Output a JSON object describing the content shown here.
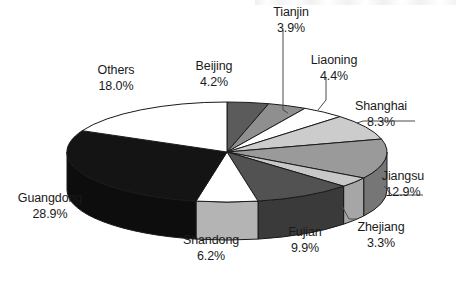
{
  "chart_data": {
    "type": "pie",
    "title": "",
    "subtitle": "",
    "units": "percent",
    "legend_position": "none",
    "labels_on_slices": false,
    "style": "3d-pie",
    "start_angle_deg": 0,
    "direction": "clockwise",
    "categories": [
      "Beijing",
      "Tianjin",
      "Liaoning",
      "Shanghai",
      "Jiangsu",
      "Zhejiang",
      "Fujian",
      "Shandong",
      "Guangdong",
      "Others"
    ],
    "values": [
      4.2,
      3.9,
      4.4,
      8.3,
      12.9,
      3.3,
      9.9,
      6.2,
      28.9,
      18.0
    ],
    "value_labels": [
      "4.2%",
      "3.9%",
      "4.4%",
      "8.3%",
      "12.9%",
      "3.3%",
      "9.9%",
      "6.2%",
      "28.9%",
      "18.0%"
    ],
    "slice_colors": [
      "#5b5b5b",
      "#8f8f8f",
      "#ffffff",
      "#cccccc",
      "#9a9a9a",
      "#c8c8c8",
      "#525252",
      "#ffffff",
      "#141414",
      "#ffffff"
    ],
    "slice_side_colors": [
      "#3f3f3f",
      "#6e6e6e",
      "#d6d6d6",
      "#a8a8a8",
      "#767676",
      "#a6a6a6",
      "#3a3a3a",
      "#b4b4b4",
      "#0d0d0d",
      "#d8d8d8"
    ],
    "outline_color": "#1a1a1a",
    "total": 100.0
  },
  "slices": [
    {
      "name": "Beijing",
      "pct": "4.2%",
      "label_x": 214,
      "label_y": 66,
      "align": "center",
      "leader": false
    },
    {
      "name": "Tianjin",
      "pct": "3.9%",
      "label_x": 291,
      "label_y": 12,
      "align": "center",
      "leader": true
    },
    {
      "name": "Liaoning",
      "pct": "4.4%",
      "label_x": 334,
      "label_y": 60,
      "align": "center",
      "leader": true
    },
    {
      "name": "Shanghai",
      "pct": "8.3%",
      "label_x": 378,
      "label_y": 106,
      "align": "center",
      "leader": true
    },
    {
      "name": "Jiangsu",
      "pct": "12.9%",
      "label_x": 400,
      "label_y": 176,
      "align": "center",
      "leader": true
    },
    {
      "name": "Zhejiang",
      "pct": "3.3%",
      "label_x": 378,
      "label_y": 227,
      "align": "center",
      "leader": true
    },
    {
      "name": "Fujian",
      "pct": "9.9%",
      "label_x": 305,
      "label_y": 232,
      "align": "center",
      "leader": false
    },
    {
      "name": "Shandong",
      "pct": "6.2%",
      "label_x": 211,
      "label_y": 240,
      "align": "center",
      "leader": false
    },
    {
      "name": "Guangdong",
      "pct": "28.9%",
      "label_x": 48,
      "label_y": 198,
      "align": "center",
      "leader": false
    },
    {
      "name": "Others",
      "pct": "18.0%",
      "label_x": 114,
      "label_y": 70,
      "align": "center",
      "leader": false
    }
  ],
  "figure": {
    "background": "#ffffff",
    "text_color": "#1a1a1a"
  }
}
